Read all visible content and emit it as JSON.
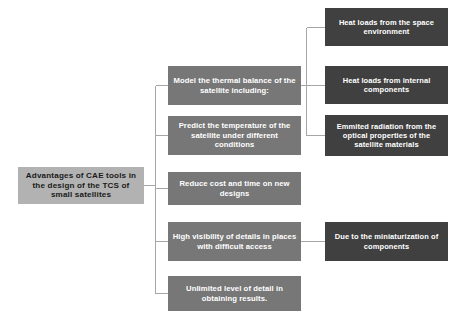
{
  "diagram": {
    "type": "tree-hierarchy",
    "orientation": "left-to-right",
    "background_color": "#ffffff",
    "connector_color": "#a6a6a6",
    "levels": [
      {
        "name": "root",
        "fill_color": "#b2b2b2",
        "text_color": "#1a1a1a"
      },
      {
        "name": "branch",
        "fill_color": "#777777",
        "text_color": "#ffffff"
      },
      {
        "name": "leaf",
        "fill_color": "#404040",
        "text_color": "#ffffff"
      }
    ]
  },
  "root": {
    "label": "Advantages of CAE tools in the design of the TCS of small satellites"
  },
  "branches": [
    {
      "id": "model-thermal-balance",
      "label": "Model the thermal balance of the satellite including:",
      "leaves": [
        {
          "id": "heat-loads-space-environment",
          "label": "Heat loads from the space environment"
        },
        {
          "id": "heat-loads-internal-components",
          "label": "Heat loads from internal components"
        },
        {
          "id": "emitted-radiation-optical-properties",
          "label": "Emmited radiation from the optical properties of the satellite materials"
        }
      ]
    },
    {
      "id": "predict-temperature",
      "label": "Predict the temperature of the satellite under different conditions",
      "leaves": []
    },
    {
      "id": "reduce-cost-and-time",
      "label": "Reduce cost and time on new designs",
      "leaves": []
    },
    {
      "id": "high-visibility-details",
      "label": "High visibility of details in places with difficult access",
      "leaves": [
        {
          "id": "due-to-miniaturization",
          "label": "Due to the miniaturization of components"
        }
      ]
    },
    {
      "id": "unlimited-level-of-detail",
      "label": "Unlimited level of detail in obtaining results.",
      "leaves": []
    }
  ]
}
